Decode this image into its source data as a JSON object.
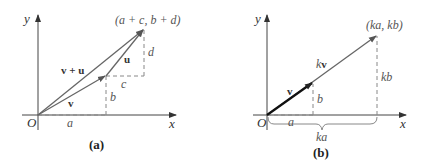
{
  "panels": [
    {
      "id": "a",
      "caption": "(a)",
      "axis_x_label": "x",
      "axis_y_label": "y",
      "origin_label": "O",
      "endpoint_label": "(a + c, b + d)",
      "vectors": [
        {
          "name": "v",
          "label": "v"
        },
        {
          "name": "u",
          "label": "u"
        },
        {
          "name": "v+u",
          "label": "v + u"
        }
      ],
      "component_labels": {
        "a": "a",
        "b": "b",
        "c": "c",
        "d": "d"
      }
    },
    {
      "id": "b",
      "caption": "(b)",
      "axis_x_label": "x",
      "axis_y_label": "y",
      "origin_label": "O",
      "endpoint_label": "(ka, kb)",
      "vectors": [
        {
          "name": "v",
          "label": "v"
        },
        {
          "name": "kv",
          "label_scalar": "k",
          "label_vector": "v"
        }
      ],
      "component_labels": {
        "a": "a",
        "b": "b",
        "ka": "ka",
        "kb": "kb"
      }
    }
  ],
  "colors": {
    "axis": "#333333",
    "vector": "#666666",
    "vector_bold": "#111111",
    "dashed": "#888888"
  }
}
